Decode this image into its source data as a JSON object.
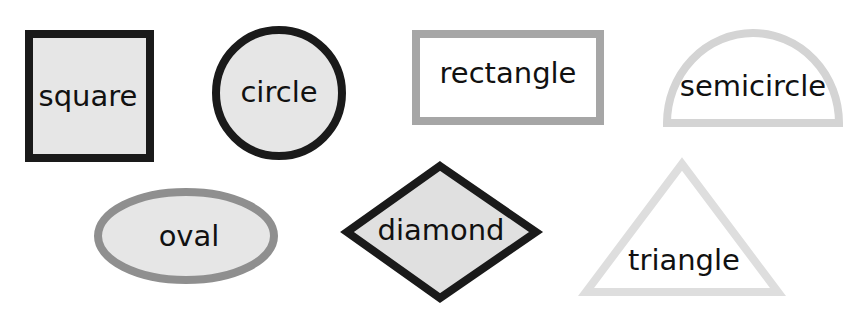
{
  "shapes": [
    {
      "id": "square",
      "label": "square",
      "stroke": "#1a1a1a",
      "fill": "#e6e6e6"
    },
    {
      "id": "circle",
      "label": "circle",
      "stroke": "#1a1a1a",
      "fill": "#e6e6e6"
    },
    {
      "id": "rectangle",
      "label": "rectangle",
      "stroke": "#a6a6a6",
      "fill": "#ffffff"
    },
    {
      "id": "semicircle",
      "label": "semicircle",
      "stroke": "#d4d4d4",
      "fill": "#ffffff"
    },
    {
      "id": "oval",
      "label": "oval",
      "stroke": "#8f8f8f",
      "fill": "#e6e6e6"
    },
    {
      "id": "diamond",
      "label": "diamond",
      "stroke": "#1a1a1a",
      "fill": "#e0e0e0"
    },
    {
      "id": "triangle",
      "label": "triangle",
      "stroke": "#dedede",
      "fill": "#ffffff"
    }
  ]
}
